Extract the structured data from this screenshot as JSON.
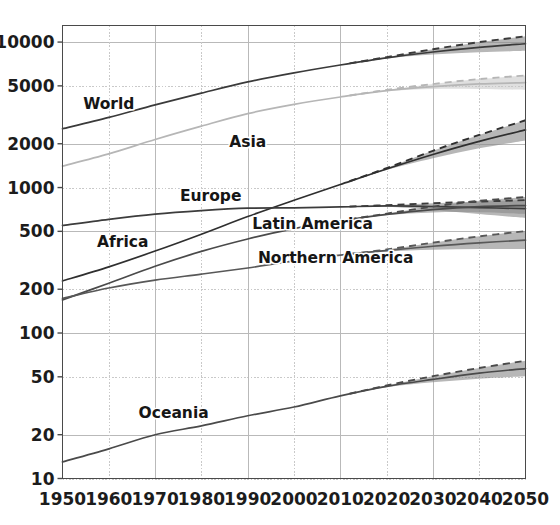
{
  "chart_data": {
    "type": "line",
    "title": "",
    "subtitle": "",
    "xlabel": "",
    "ylabel": "",
    "yscale": "log",
    "xlim": [
      1950,
      2050
    ],
    "ylim": [
      10,
      13000
    ],
    "grid": true,
    "legend_position": "inline-labels",
    "x_ticks": [
      "1950",
      "1960",
      "1970",
      "1980",
      "1990",
      "2000",
      "2010",
      "2020",
      "2030",
      "2040",
      "2050"
    ],
    "y_ticks": [
      "10000",
      "5000",
      "2000",
      "1000",
      "500",
      "200",
      "100",
      "50",
      "20",
      "10"
    ],
    "projection_start_year": 2012,
    "x": [
      1950,
      1960,
      1970,
      1980,
      1990,
      2000,
      2010,
      2020,
      2030,
      2040,
      2050
    ],
    "series": [
      {
        "name": "World",
        "color": "#3a3a3a",
        "label_x": 1960,
        "label_y": 3750,
        "values": [
          2536,
          3034,
          3700,
          4458,
          5327,
          6143,
          6957,
          7795,
          8548,
          9198,
          9735
        ],
        "upper": [
          2536,
          3034,
          3700,
          4458,
          5327,
          6143,
          6957,
          7880,
          8930,
          9990,
          10960
        ],
        "lower": [
          2536,
          3034,
          3700,
          4458,
          5327,
          6143,
          6957,
          7720,
          8220,
          8500,
          8700
        ]
      },
      {
        "name": "Asia",
        "color": "#b6b6b6",
        "label_x": 1990,
        "label_y": 2060,
        "values": [
          1405,
          1704,
          2139,
          2642,
          3221,
          3730,
          4194,
          4641,
          4947,
          5154,
          5257
        ],
        "upper": [
          1405,
          1704,
          2139,
          2642,
          3221,
          3730,
          4194,
          4690,
          5150,
          5570,
          5890
        ],
        "lower": [
          1405,
          1704,
          2139,
          2642,
          3221,
          3730,
          4194,
          4590,
          4760,
          4760,
          4690
        ]
      },
      {
        "name": "Africa",
        "color": "#2f2f2f",
        "label_x": 1963,
        "label_y": 420,
        "values": [
          228,
          285,
          366,
          478,
          632,
          818,
          1049,
          1341,
          1688,
          2077,
          2489
        ],
        "upper": [
          228,
          285,
          366,
          478,
          632,
          818,
          1049,
          1360,
          1790,
          2300,
          2900
        ],
        "lower": [
          228,
          285,
          366,
          478,
          632,
          818,
          1049,
          1320,
          1590,
          1860,
          2110
        ]
      },
      {
        "name": "Europe",
        "color": "#3c3c3c",
        "label_x": 1982,
        "label_y": 880,
        "values": [
          549,
          605,
          657,
          694,
          721,
          726,
          736,
          748,
          741,
          728,
          716
        ],
        "upper": [
          549,
          605,
          657,
          694,
          721,
          726,
          736,
          757,
          780,
          800,
          820
        ],
        "lower": [
          549,
          605,
          657,
          694,
          721,
          726,
          736,
          739,
          702,
          658,
          618
        ]
      },
      {
        "name": "Latin America",
        "color": "#4a4a4a",
        "label_x": 2004,
        "label_y": 560,
        "values": [
          169,
          220,
          288,
          364,
          443,
          522,
          591,
          654,
          706,
          740,
          752
        ],
        "upper": [
          169,
          220,
          288,
          364,
          443,
          522,
          591,
          662,
          740,
          810,
          860
        ],
        "lower": [
          169,
          220,
          288,
          364,
          443,
          522,
          591,
          646,
          674,
          676,
          660
        ]
      },
      {
        "name": "Northern America",
        "color": "#585858",
        "label_x": 2009,
        "label_y": 330,
        "values": [
          173,
          204,
          231,
          254,
          280,
          313,
          343,
          369,
          395,
          417,
          435
        ],
        "upper": [
          173,
          204,
          231,
          254,
          280,
          313,
          343,
          375,
          418,
          462,
          502
        ],
        "lower": [
          173,
          204,
          231,
          254,
          280,
          313,
          343,
          363,
          374,
          378,
          378
        ]
      },
      {
        "name": "Oceania",
        "color": "#4a4a4a",
        "label_x": 1974,
        "label_y": 28,
        "values": [
          13,
          16,
          20,
          23,
          27,
          31,
          37,
          43,
          48,
          53,
          57
        ],
        "upper": [
          13,
          16,
          20,
          23,
          27,
          31,
          37,
          43.6,
          50.5,
          57.5,
          64.5
        ],
        "lower": [
          13,
          16,
          20,
          23,
          27,
          31,
          37,
          42.4,
          45.8,
          48.5,
          50.5
        ]
      }
    ]
  },
  "axes": {
    "y_ticks": [
      "10000",
      "5000",
      "2000",
      "1000",
      "500",
      "200",
      "100",
      "50",
      "20",
      "10"
    ],
    "x_ticks": [
      "1950",
      "1960",
      "1970",
      "1980",
      "1990",
      "2000",
      "2010",
      "2020",
      "2030",
      "2040",
      "2050"
    ]
  },
  "labels": {
    "world": "World",
    "asia": "Asia",
    "africa": "Africa",
    "europe": "Europe",
    "latin_america": "Latin America",
    "northern_america": "Northern America",
    "oceania": "Oceania"
  },
  "colors": {
    "grid": "#b9b9b9",
    "frame": "#4a4a4a",
    "band_dark": "#8a8a8a",
    "band_light": "#c4c4c4",
    "background": "#ffffff"
  }
}
